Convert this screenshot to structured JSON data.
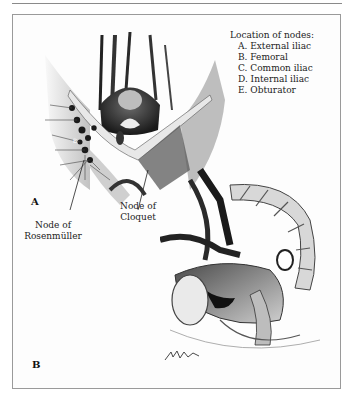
{
  "figure": {
    "legend": {
      "title": "Location of nodes:",
      "items": [
        {
          "key": "A",
          "label": "A. External iliac"
        },
        {
          "key": "B",
          "label": "B. Femoral"
        },
        {
          "key": "C",
          "label": "C. Common iliac"
        },
        {
          "key": "D",
          "label": "D. Internal iliac"
        },
        {
          "key": "E",
          "label": "E. Obturator"
        }
      ]
    },
    "panels": [
      {
        "label": "A",
        "description": "Anterior view of inguinal/femoral region with lymph nodes"
      },
      {
        "label": "B",
        "description": "Sagittal section of female pelvis with pelvic lymph nodes"
      }
    ],
    "callouts": {
      "rosenmuller": {
        "line1": "Node of",
        "line2": "Rosenmüller"
      },
      "cloquet": {
        "line1": "Node of",
        "line2": "Cloquet"
      }
    },
    "node_marker": "B",
    "colors": {
      "ink": "#1a1a1a",
      "frame": "#9a9a9a",
      "background": "#ffffff"
    }
  }
}
